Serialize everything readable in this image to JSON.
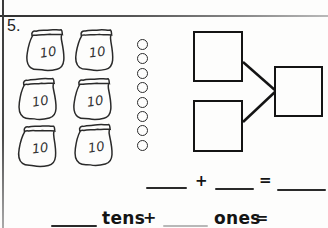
{
  "worksheet": {
    "problem_number": "5.",
    "tens_group": {
      "bag_count": 6,
      "bag_label": "10"
    },
    "ones_group": {
      "circle_count": 8
    },
    "equation_sum": {
      "plus": "+",
      "equals": "="
    },
    "equation_place_value": {
      "tens_label": "tens",
      "plus": "+",
      "ones_label": "ones",
      "equals": "="
    }
  },
  "colors": {
    "ink": "#141414",
    "blank": "#2a2a2a",
    "faint_blank": "#b8b8b8"
  }
}
